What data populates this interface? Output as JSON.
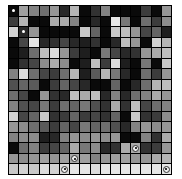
{
  "grid": {
    "rows": 16,
    "cols": 16,
    "values": [
      [
        10,
        160,
        130,
        110,
        150,
        40,
        180,
        10,
        50,
        130,
        10,
        10,
        10,
        60,
        10,
        150
      ],
      [
        60,
        180,
        10,
        10,
        170,
        170,
        130,
        10,
        40,
        10,
        230,
        120,
        10,
        110,
        60,
        140
      ],
      [
        210,
        40,
        150,
        10,
        10,
        10,
        10,
        200,
        100,
        10,
        200,
        190,
        150,
        70,
        100,
        30
      ],
      [
        10,
        70,
        230,
        40,
        50,
        70,
        40,
        30,
        50,
        10,
        40,
        190,
        150,
        10,
        210,
        180
      ],
      [
        10,
        30,
        110,
        190,
        220,
        150,
        60,
        30,
        10,
        120,
        70,
        40,
        50,
        150,
        170,
        190
      ],
      [
        10,
        50,
        70,
        140,
        170,
        140,
        10,
        30,
        190,
        60,
        220,
        30,
        10,
        120,
        10,
        200
      ],
      [
        130,
        220,
        110,
        70,
        60,
        110,
        180,
        30,
        90,
        180,
        120,
        40,
        10,
        110,
        60,
        150
      ],
      [
        80,
        100,
        90,
        10,
        60,
        100,
        70,
        40,
        10,
        10,
        100,
        10,
        40,
        110,
        180,
        190
      ],
      [
        110,
        70,
        10,
        150,
        50,
        40,
        190,
        170,
        190,
        40,
        130,
        40,
        110,
        130,
        170,
        150
      ],
      [
        130,
        80,
        70,
        120,
        60,
        110,
        100,
        120,
        80,
        50,
        170,
        50,
        190,
        70,
        110,
        130
      ],
      [
        210,
        70,
        100,
        200,
        50,
        60,
        100,
        60,
        70,
        50,
        100,
        10,
        200,
        50,
        60,
        140
      ],
      [
        150,
        140,
        110,
        90,
        60,
        100,
        70,
        120,
        100,
        110,
        80,
        40,
        130,
        150,
        140,
        150
      ],
      [
        130,
        140,
        140,
        30,
        40,
        130,
        150,
        140,
        150,
        140,
        150,
        10,
        10,
        130,
        50,
        170
      ],
      [
        10,
        110,
        130,
        60,
        70,
        100,
        170,
        120,
        140,
        40,
        50,
        170,
        170,
        50,
        60,
        150
      ],
      [
        150,
        140,
        150,
        160,
        150,
        160,
        170,
        160,
        130,
        150,
        160,
        160,
        150,
        150,
        170,
        180
      ],
      [
        200,
        210,
        200,
        220,
        210,
        220,
        230,
        230,
        220,
        230,
        230,
        230,
        230,
        230,
        230,
        230
      ]
    ],
    "markers": [
      {
        "row": 0,
        "col": 0,
        "type": "dot"
      },
      {
        "row": 2,
        "col": 1,
        "type": "dot"
      },
      {
        "row": 13,
        "col": 12,
        "type": "diamond"
      },
      {
        "row": 14,
        "col": 6,
        "type": "diamond"
      },
      {
        "row": 15,
        "col": 5,
        "type": "diamond"
      },
      {
        "row": 15,
        "col": 15,
        "type": "diamond"
      }
    ]
  }
}
